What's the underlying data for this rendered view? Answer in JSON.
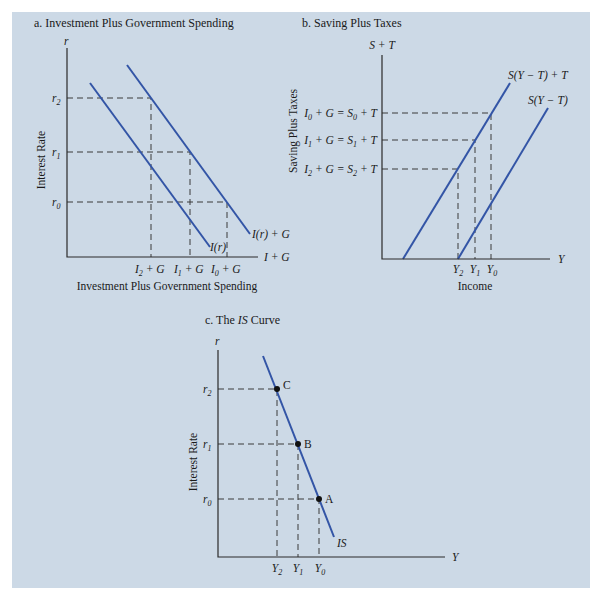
{
  "figure": {
    "panel_a": {
      "title": "a. Investment Plus Government Spending",
      "y_axis_symbol": "r",
      "y_axis_label": "Interest Rate",
      "x_axis_symbol": "I + G",
      "x_axis_label": "Investment Plus Government Spending",
      "y_ticks": [
        "r2",
        "r1",
        "r0"
      ],
      "x_ticks": [
        "I2 + G",
        "I1 + G",
        "I0 + G"
      ],
      "curves": [
        "I(r)",
        "I(r) + G"
      ]
    },
    "panel_b": {
      "title": "b. Saving Plus Taxes",
      "y_axis_symbol": "S + T",
      "y_axis_label": "Saving Plus Taxes",
      "x_axis_symbol": "Y",
      "x_axis_label": "Income",
      "y_ticks": [
        "I0 + G = S0 + T",
        "I1 + G = S1 + T",
        "I2 + G = S2 + T"
      ],
      "x_ticks": [
        "Y2",
        "Y1",
        "Y0"
      ],
      "curves": [
        "S(Y − T) + T",
        "S(Y − T)"
      ]
    },
    "panel_c": {
      "title_prefix": "c. The ",
      "title_italic": "IS",
      "title_suffix": " Curve",
      "y_axis_symbol": "r",
      "y_axis_label": "Interest Rate",
      "x_axis_symbol": "Y",
      "y_ticks": [
        "r2",
        "r1",
        "r0"
      ],
      "x_ticks": [
        "Y2",
        "Y1",
        "Y0"
      ],
      "points": [
        "C",
        "B",
        "A"
      ],
      "curve_label": "IS"
    }
  },
  "colors": {
    "background": "#ccd9e6",
    "curve": "#3355a6",
    "axis": "#2a2a2a"
  }
}
